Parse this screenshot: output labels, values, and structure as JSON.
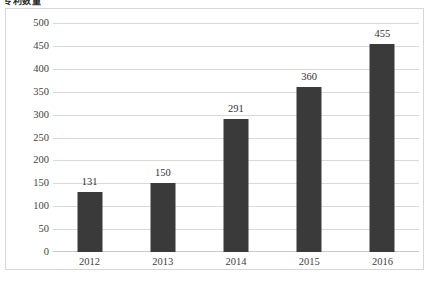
{
  "chart_data": {
    "type": "bar",
    "title": "专利数量",
    "xlabel": "",
    "ylabel": "",
    "categories": [
      "2012",
      "2013",
      "2014",
      "2015",
      "2016"
    ],
    "values": [
      131,
      150,
      291,
      360,
      455
    ],
    "data_labels": [
      "131",
      "150",
      "291",
      "360",
      "455"
    ],
    "ylim": [
      0,
      500
    ],
    "ytick_step": 50,
    "yticks": [
      "500",
      "450",
      "400",
      "350",
      "300",
      "250",
      "200",
      "150",
      "100",
      "50",
      "0"
    ],
    "grid": true,
    "grid_axis": "y",
    "legend": false,
    "legend_position": "none",
    "series": [
      {
        "name": "",
        "values": [
          131,
          150,
          291,
          360,
          455
        ]
      }
    ],
    "colors": {
      "bar": "#3a3a3a",
      "gridline": "#d9d9d9",
      "baseline": "#c9c9c9",
      "frame_border": "#d7d7d7",
      "tick_label": "#3f3f3f",
      "data_label": "#333333",
      "plot_background": "#ffffff"
    }
  }
}
